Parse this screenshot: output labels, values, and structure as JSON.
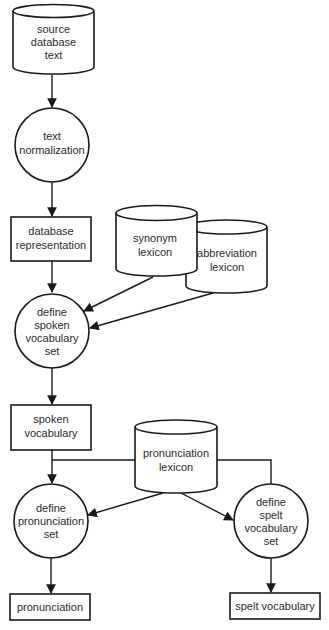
{
  "diagram": {
    "type": "data-flow",
    "colors": {
      "stroke": "#1a1a1a",
      "text": "#2a2a2a",
      "background": "#ffffff"
    },
    "nodes": {
      "source_db": {
        "shape": "cylinder",
        "lines": [
          "source",
          "database",
          "text"
        ]
      },
      "text_norm": {
        "shape": "circle",
        "lines": [
          "text",
          "normalization"
        ]
      },
      "db_repr": {
        "shape": "rectangle",
        "lines": [
          "database",
          "representation"
        ]
      },
      "synonym_lex": {
        "shape": "cylinder",
        "lines": [
          "synonym",
          "lexicon"
        ]
      },
      "abbrev_lex": {
        "shape": "cylinder",
        "lines": [
          "abbreviation",
          "lexicon"
        ]
      },
      "define_spoken": {
        "shape": "circle",
        "lines": [
          "define",
          "spoken",
          "vocabulary",
          "set"
        ]
      },
      "spoken_vocab": {
        "shape": "rectangle",
        "lines": [
          "spoken",
          "vocabulary"
        ]
      },
      "pron_lex": {
        "shape": "cylinder",
        "lines": [
          "pronunciation",
          "lexicon"
        ]
      },
      "define_pron": {
        "shape": "circle",
        "lines": [
          "define",
          "pronunciation",
          "set"
        ]
      },
      "define_spelt": {
        "shape": "circle",
        "lines": [
          "define",
          "spelt",
          "vocabulary",
          "set"
        ]
      },
      "pronunciation": {
        "shape": "rectangle",
        "lines": [
          "pronunciation"
        ]
      },
      "spelt_vocab": {
        "shape": "rectangle",
        "lines": [
          "spelt vocabulary"
        ]
      }
    },
    "edges": [
      {
        "from": "source_db",
        "to": "text_norm"
      },
      {
        "from": "text_norm",
        "to": "db_repr"
      },
      {
        "from": "db_repr",
        "to": "define_spoken"
      },
      {
        "from": "synonym_lex",
        "to": "define_spoken"
      },
      {
        "from": "abbrev_lex",
        "to": "define_spoken"
      },
      {
        "from": "define_spoken",
        "to": "spoken_vocab"
      },
      {
        "from": "spoken_vocab",
        "to": "define_pron"
      },
      {
        "from": "spoken_vocab",
        "to": "define_spelt",
        "style": "line-via-pron-lex-row"
      },
      {
        "from": "pron_lex",
        "to": "define_pron"
      },
      {
        "from": "pron_lex",
        "to": "define_spelt"
      },
      {
        "from": "define_pron",
        "to": "pronunciation"
      },
      {
        "from": "define_spelt",
        "to": "spelt_vocab"
      }
    ]
  }
}
